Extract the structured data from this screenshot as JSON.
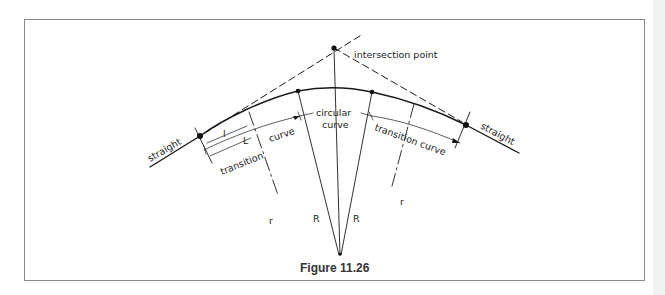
{
  "figure": {
    "caption": "Figure 11.26",
    "labels": {
      "intersection_point": "intersection point",
      "straight_left": "straight",
      "straight_right": "straight",
      "circular_curve_line1": "circular",
      "circular_curve_line2": "curve",
      "transition_curve_left_word1": "transition",
      "transition_curve_left_word2": "curve",
      "transition_curve_right": "transition curve",
      "radius_R_left": "R",
      "radius_R_right": "R",
      "radius_r_left": "r",
      "radius_r_right": "r",
      "length_l": "l",
      "length_L": "L"
    },
    "colors": {
      "line": "#1a1a1a",
      "frame": "#8a8a8a",
      "background": "#ffffff"
    }
  }
}
